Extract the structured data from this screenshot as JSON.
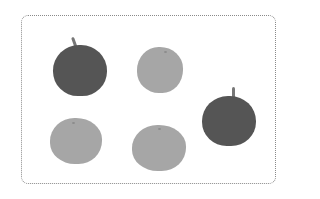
{
  "scene": {
    "description": "Counting picture: apples and oranges inside dotted frame",
    "colors": {
      "apple": "#555555",
      "orange": "#a6a6a6",
      "frame": "#8a8a8a"
    },
    "fruits": [
      {
        "type": "apple",
        "x": 53,
        "y": 37,
        "w": 54,
        "h": 59
      },
      {
        "type": "orange",
        "x": 137,
        "y": 47,
        "w": 46,
        "h": 46
      },
      {
        "type": "apple",
        "x": 202,
        "y": 87,
        "w": 54,
        "h": 59
      },
      {
        "type": "orange",
        "x": 50,
        "y": 118,
        "w": 52,
        "h": 46
      },
      {
        "type": "orange",
        "x": 132,
        "y": 125,
        "w": 54,
        "h": 46
      }
    ]
  }
}
